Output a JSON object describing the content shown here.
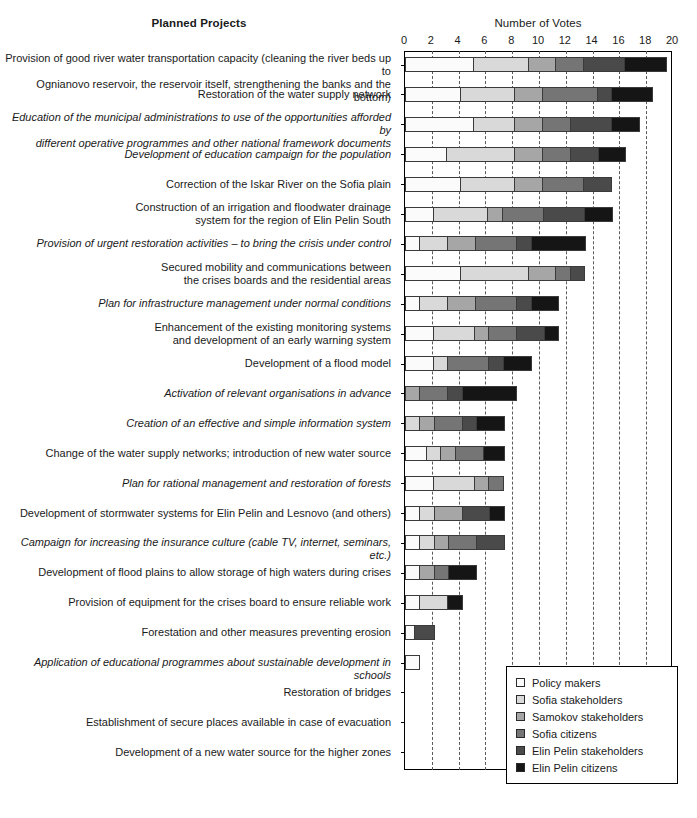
{
  "header": {
    "y_axis_title": "Planned Projects",
    "x_axis_title": "Number of Votes"
  },
  "legend": {
    "position": "bottom-right",
    "items": [
      {
        "label": "Policy makers",
        "color": "#fbfbfb"
      },
      {
        "label": "Sofia stakeholders",
        "color": "#d9d9d9"
      },
      {
        "label": "Samokov stakeholders",
        "color": "#a6a6a6"
      },
      {
        "label": "Sofia citizens",
        "color": "#757575"
      },
      {
        "label": "Elin Pelin stakeholders",
        "color": "#4a4a4a"
      },
      {
        "label": "Elin Pelin citizens",
        "color": "#151515"
      }
    ]
  },
  "chart_data": {
    "type": "bar",
    "orientation": "horizontal",
    "stacked": true,
    "title": "",
    "xlabel": "Number of Votes",
    "ylabel": "Planned Projects",
    "xlim": [
      0,
      20
    ],
    "xticks": [
      0,
      2,
      4,
      6,
      8,
      10,
      12,
      14,
      16,
      18,
      20
    ],
    "grid": "vertical-dashed",
    "categories": [
      "Provision of good river water transportation capacity (cleaning the river beds up to Ognianovo reservoir, the reservoir itself, strengthening the banks and the bottom)",
      "Restoration of the water supply network",
      "Education of the municipal administrations to use of the opportunities afforded by different operative programmes and other national framework documents",
      "Development of education campaign for the population",
      "Correction of the Iskar River on the Sofia plain",
      "Construction of an irrigation and floodwater drainage system for the region of Elin Pelin South",
      "Provision of urgent restoration activities – to bring the crisis under control",
      "Secured mobility and communications between the crises boards and the residential areas",
      "Plan for infrastructure management under normal conditions",
      "Enhancement of the existing monitoring systems and development of an early warning system",
      "Development of a flood model",
      "Activation of relevant organisations in advance",
      "Creation of an effective and simple information system",
      "Change of the water supply networks; introduction of new water source",
      "Plan for rational management and restoration of forests",
      "Development of stormwater systems for Elin Pelin and Lesnovo (and others)",
      "Campaign for increasing the insurance culture (cable TV, internet, seminars, etc.)",
      "Development of flood plains to allow storage of high waters during crises",
      "Provision of equipment for the crises board to ensure reliable work",
      "Forestation and other measures preventing erosion",
      "Application of educational programmes about sustainable development in schools",
      "Restoration of bridges",
      "Establishment of secure places available in case of evacuation",
      "Development of a new water source for the higher zones"
    ],
    "category_styles": [
      "normal",
      "normal",
      "italic",
      "italic",
      "normal",
      "normal",
      "italic",
      "normal",
      "italic",
      "normal",
      "normal",
      "italic",
      "italic",
      "normal",
      "italic",
      "normal",
      "italic",
      "normal",
      "normal",
      "normal",
      "italic",
      "normal",
      "normal",
      "normal"
    ],
    "category_lines": [
      [
        "Provision of good river water transportation capacity (cleaning the river beds up to",
        "Ognianovo reservoir, the reservoir itself, strengthening the banks and the bottom)"
      ],
      [
        "Restoration of the water supply network"
      ],
      [
        "Education of the municipal administrations to use of the opportunities afforded by",
        "different operative programmes and other national framework documents"
      ],
      [
        "Development of education campaign for the population"
      ],
      [
        "Correction of the Iskar River on the Sofia plain"
      ],
      [
        "Construction of an irrigation and floodwater drainage",
        "system for the region of Elin Pelin South"
      ],
      [
        "Provision of urgent restoration activities – to bring the crisis under control"
      ],
      [
        "Secured mobility and communications between",
        "the crises boards and the residential areas"
      ],
      [
        "Plan for infrastructure management under normal conditions"
      ],
      [
        "Enhancement of the existing monitoring systems",
        "and development of an early warning system"
      ],
      [
        "Development of a flood model"
      ],
      [
        "Activation of relevant organisations in advance"
      ],
      [
        "Creation of an effective and simple information system"
      ],
      [
        "Change of the water supply networks; introduction of new water source"
      ],
      [
        "Plan for rational management and restoration of forests"
      ],
      [
        "Development of stormwater systems for Elin Pelin and Lesnovo (and others)"
      ],
      [
        "Campaign for increasing the insurance culture (cable TV, internet, seminars, etc.)"
      ],
      [
        "Development of flood plains to allow storage of high waters during crises"
      ],
      [
        "Provision of equipment for the crises board to ensure reliable work"
      ],
      [
        "Forestation and other measures preventing erosion"
      ],
      [
        "Application of educational programmes about sustainable development in schools"
      ],
      [
        "Restoration of bridges"
      ],
      [
        "Establishment of secure places available in case of evacuation"
      ],
      [
        "Development of a new water source for the higher zones"
      ]
    ],
    "series": [
      {
        "name": "Policy makers",
        "color": "#fbfbfb",
        "values": [
          5,
          4,
          5,
          3,
          4,
          2,
          1,
          4,
          1,
          2,
          2,
          0,
          0,
          1.5,
          2,
          1,
          1,
          1,
          1,
          0.6,
          1,
          0,
          0,
          0
        ]
      },
      {
        "name": "Sofia stakeholders",
        "color": "#d9d9d9",
        "values": [
          4,
          4,
          3,
          5,
          4,
          4,
          2,
          5,
          2,
          3,
          1,
          0,
          1,
          1,
          3,
          1,
          1,
          0,
          2,
          0,
          0,
          0,
          0,
          0
        ]
      },
      {
        "name": "Samokov stakeholders",
        "color": "#a6a6a6",
        "values": [
          2,
          2,
          2,
          2,
          2,
          1,
          2,
          2,
          2,
          1,
          0,
          1,
          1,
          1,
          1,
          2,
          1,
          1,
          0,
          0,
          0,
          0,
          0,
          0
        ]
      },
      {
        "name": "Sofia citizens",
        "color": "#757575",
        "values": [
          2,
          4,
          2,
          2,
          3,
          3,
          3,
          1,
          3,
          2,
          3,
          2,
          2,
          2,
          1,
          0,
          2,
          1,
          0,
          0,
          0,
          0,
          0,
          0
        ]
      },
      {
        "name": "Elin Pelin stakeholders",
        "color": "#4a4a4a",
        "values": [
          3,
          1,
          3,
          2,
          2,
          3,
          1,
          1,
          1,
          2,
          1,
          1,
          1,
          0,
          0,
          2,
          2,
          0,
          0,
          1.4,
          0,
          0,
          0,
          0
        ]
      },
      {
        "name": "Elin Pelin citizens",
        "color": "#151515",
        "values": [
          3,
          3,
          2,
          2,
          0,
          2,
          4,
          0,
          2,
          1,
          2,
          4,
          2,
          1.5,
          0,
          1,
          0,
          2,
          1,
          0,
          0,
          0,
          0,
          0
        ]
      }
    ],
    "totals": [
      19,
      18,
      17,
      16,
      15,
      15,
      13,
      13,
      11,
      11,
      9,
      8,
      7,
      7,
      7,
      7,
      7,
      5,
      4,
      2,
      1,
      0,
      0,
      0
    ]
  }
}
